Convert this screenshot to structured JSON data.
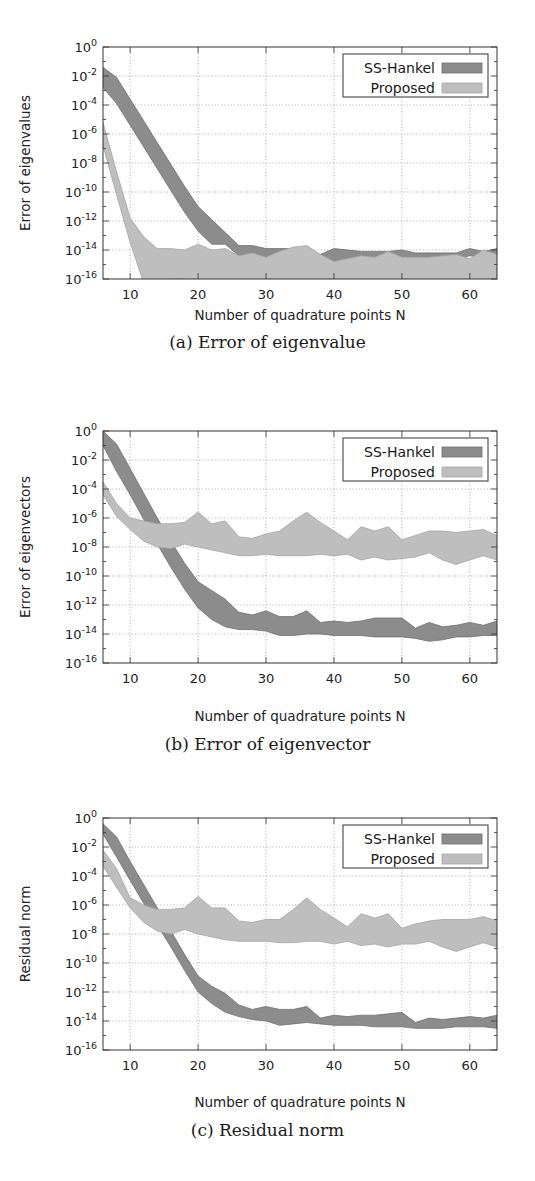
{
  "colors": {
    "ss_hankel_fill": "#8c8c8c",
    "ss_hankel_edge": "#6e6e6e",
    "proposed_fill": "#bebebe",
    "proposed_edge": "#a5a5a5",
    "grid": "#9a9a9a",
    "frame": "#333333"
  },
  "chart_data": [
    {
      "id": "a",
      "type": "area",
      "caption": "(a) Error of eigenvalue",
      "title": "",
      "xlabel": "Number of quadrature points N",
      "ylabel": "Error of eigenvalues",
      "xlim": [
        6,
        64
      ],
      "ylim_log10": [
        -16,
        0
      ],
      "yscale": "log",
      "grid": true,
      "legend_position": "upper right",
      "x_ticks": [
        10,
        20,
        30,
        40,
        50,
        60
      ],
      "y_ticks": [
        "10^0",
        "10^-2",
        "10^-4",
        "10^-6",
        "10^-8",
        "10^-10",
        "10^-12",
        "10^-14",
        "10^-16"
      ],
      "legend": [
        "SS-Hankel",
        "Proposed"
      ],
      "x": [
        6,
        8,
        10,
        12,
        14,
        16,
        18,
        20,
        22,
        24,
        26,
        28,
        30,
        32,
        34,
        36,
        38,
        40,
        42,
        44,
        46,
        48,
        50,
        52,
        54,
        56,
        58,
        60,
        62,
        64
      ],
      "series": [
        {
          "name": "SS-Hankel",
          "upper_log10": [
            -1.4,
            -2.1,
            -3.6,
            -5.1,
            -6.6,
            -8.1,
            -9.6,
            -11.0,
            -11.9,
            -12.8,
            -13.7,
            -13.7,
            -13.9,
            -13.9,
            -13.9,
            -14.1,
            -14.3,
            -13.9,
            -14.0,
            -14.1,
            -14.1,
            -14.1,
            -14.0,
            -14.2,
            -14.2,
            -14.2,
            -14.2,
            -13.9,
            -14.1,
            -13.9
          ],
          "lower_log10": [
            -2.8,
            -3.9,
            -5.4,
            -6.9,
            -8.4,
            -9.9,
            -11.4,
            -12.7,
            -13.6,
            -13.6,
            -14.4,
            -14.3,
            -14.5,
            -14.4,
            -14.3,
            -14.2,
            -14.5,
            -14.9,
            -14.7,
            -14.6,
            -14.6,
            -14.6,
            -14.6,
            -14.5,
            -14.6,
            -14.6,
            -14.6,
            -14.4,
            -14.5,
            -14.3
          ]
        },
        {
          "name": "Proposed",
          "upper_log10": [
            -5.2,
            -8.6,
            -11.8,
            -13.1,
            -13.9,
            -13.9,
            -14.0,
            -13.6,
            -14.0,
            -13.9,
            -14.4,
            -14.2,
            -14.5,
            -14.1,
            -13.8,
            -13.7,
            -14.3,
            -14.8,
            -14.6,
            -14.4,
            -14.5,
            -14.1,
            -14.5,
            -14.5,
            -14.5,
            -14.4,
            -14.3,
            -14.6,
            -14.0,
            -14.3
          ],
          "lower_log10": [
            -6.8,
            -10.2,
            -13.5,
            -16.3,
            -16.3,
            -16.0,
            -16.0,
            -16.3,
            -16.3,
            -16.3,
            -16.3,
            -16.3,
            -16.3,
            -16.3,
            -16.3,
            -16.3,
            -16.3,
            -16.3,
            -16.3,
            -16.3,
            -16.3,
            -16.3,
            -16.3,
            -16.3,
            -16.3,
            -16.3,
            -16.3,
            -16.3,
            -16.3,
            -16.3
          ]
        }
      ]
    },
    {
      "id": "b",
      "type": "area",
      "caption": "(b) Error of eigenvector",
      "title": "",
      "xlabel": "Number of quadrature points N",
      "ylabel": "Error of eigenvectors",
      "xlim": [
        6,
        64
      ],
      "ylim_log10": [
        -16,
        0
      ],
      "yscale": "log",
      "grid": true,
      "legend_position": "upper right",
      "x_ticks": [
        10,
        20,
        30,
        40,
        50,
        60
      ],
      "y_ticks": [
        "10^0",
        "10^-2",
        "10^-4",
        "10^-6",
        "10^-8",
        "10^-10",
        "10^-12",
        "10^-14",
        "10^-16"
      ],
      "legend": [
        "SS-Hankel",
        "Proposed"
      ],
      "x": [
        6,
        8,
        10,
        12,
        14,
        16,
        18,
        20,
        22,
        24,
        26,
        28,
        30,
        32,
        34,
        36,
        38,
        40,
        42,
        44,
        46,
        48,
        50,
        52,
        54,
        56,
        58,
        60,
        62,
        64
      ],
      "series": [
        {
          "name": "SS-Hankel",
          "upper_log10": [
            0.0,
            -0.9,
            -2.6,
            -4.3,
            -6.0,
            -7.6,
            -9.1,
            -10.4,
            -11.0,
            -11.6,
            -12.5,
            -12.7,
            -12.4,
            -12.8,
            -12.8,
            -12.4,
            -13.2,
            -13.1,
            -13.2,
            -13.1,
            -12.9,
            -12.9,
            -12.9,
            -13.6,
            -13.2,
            -13.5,
            -13.4,
            -13.2,
            -13.4,
            -13.1
          ],
          "lower_log10": [
            -1.0,
            -2.8,
            -4.4,
            -6.1,
            -7.8,
            -9.4,
            -10.9,
            -12.2,
            -13.0,
            -13.5,
            -13.7,
            -13.7,
            -13.8,
            -14.1,
            -14.1,
            -14.0,
            -14.0,
            -14.1,
            -14.1,
            -14.1,
            -14.2,
            -14.2,
            -14.2,
            -14.3,
            -14.5,
            -14.4,
            -14.2,
            -14.2,
            -14.1,
            -14.1
          ]
        },
        {
          "name": "Proposed",
          "upper_log10": [
            -3.5,
            -5.0,
            -6.0,
            -6.2,
            -6.4,
            -6.4,
            -6.3,
            -5.6,
            -6.4,
            -6.2,
            -7.3,
            -7.4,
            -7.1,
            -6.9,
            -6.2,
            -5.6,
            -6.3,
            -6.9,
            -7.5,
            -6.6,
            -6.9,
            -6.6,
            -7.5,
            -7.2,
            -6.9,
            -6.9,
            -7.0,
            -6.9,
            -6.8,
            -7.2
          ],
          "lower_log10": [
            -4.4,
            -5.9,
            -6.8,
            -7.6,
            -8.0,
            -8.1,
            -7.8,
            -8.0,
            -8.2,
            -8.4,
            -8.6,
            -8.6,
            -8.5,
            -8.6,
            -8.6,
            -8.6,
            -8.5,
            -8.6,
            -8.5,
            -8.9,
            -8.7,
            -8.9,
            -8.8,
            -8.7,
            -8.4,
            -8.9,
            -9.2,
            -8.9,
            -8.6,
            -8.9
          ]
        }
      ]
    },
    {
      "id": "c",
      "type": "area",
      "caption": "(c) Residual norm",
      "title": "",
      "xlabel": "Number of quadrature points N",
      "ylabel": "Residual norm",
      "xlim": [
        6,
        64
      ],
      "ylim_log10": [
        -16,
        0
      ],
      "yscale": "log",
      "grid": true,
      "legend_position": "upper right",
      "x_ticks": [
        10,
        20,
        30,
        40,
        50,
        60
      ],
      "y_ticks": [
        "10^0",
        "10^-2",
        "10^-4",
        "10^-6",
        "10^-8",
        "10^-10",
        "10^-12",
        "10^-14",
        "10^-16"
      ],
      "legend": [
        "SS-Hankel",
        "Proposed"
      ],
      "x": [
        6,
        8,
        10,
        12,
        14,
        16,
        18,
        20,
        22,
        24,
        26,
        28,
        30,
        32,
        34,
        36,
        38,
        40,
        42,
        44,
        46,
        48,
        50,
        52,
        54,
        56,
        58,
        60,
        62,
        64
      ],
      "series": [
        {
          "name": "SS-Hankel",
          "upper_log10": [
            -0.4,
            -1.3,
            -3.0,
            -4.6,
            -6.2,
            -7.8,
            -9.4,
            -10.9,
            -11.6,
            -12.1,
            -12.9,
            -13.2,
            -13.0,
            -13.2,
            -13.2,
            -13.0,
            -13.8,
            -13.6,
            -13.7,
            -13.6,
            -13.6,
            -13.5,
            -13.4,
            -14.1,
            -13.8,
            -13.9,
            -13.8,
            -13.7,
            -13.8,
            -13.6
          ],
          "lower_log10": [
            -1.1,
            -2.7,
            -4.3,
            -5.9,
            -7.4,
            -8.9,
            -10.5,
            -12.0,
            -12.8,
            -13.4,
            -13.7,
            -13.9,
            -14.0,
            -14.3,
            -14.2,
            -14.1,
            -14.2,
            -14.3,
            -14.3,
            -14.3,
            -14.4,
            -14.4,
            -14.4,
            -14.5,
            -14.5,
            -14.5,
            -14.4,
            -14.4,
            -14.4,
            -14.5
          ]
        },
        {
          "name": "Proposed",
          "upper_log10": [
            -2.2,
            -3.5,
            -5.5,
            -6.0,
            -6.3,
            -6.3,
            -6.2,
            -5.4,
            -6.2,
            -6.2,
            -7.1,
            -7.2,
            -7.0,
            -7.0,
            -6.3,
            -5.5,
            -6.3,
            -6.9,
            -7.5,
            -6.6,
            -6.9,
            -6.6,
            -7.6,
            -7.3,
            -7.1,
            -7.0,
            -7.0,
            -7.0,
            -6.8,
            -7.1
          ],
          "lower_log10": [
            -3.3,
            -4.8,
            -6.2,
            -7.2,
            -7.8,
            -8.0,
            -7.7,
            -8.0,
            -8.2,
            -8.4,
            -8.5,
            -8.5,
            -8.5,
            -8.6,
            -8.6,
            -8.5,
            -8.5,
            -8.7,
            -8.5,
            -8.8,
            -8.7,
            -8.9,
            -8.7,
            -8.7,
            -8.5,
            -8.9,
            -9.2,
            -8.9,
            -8.6,
            -8.9
          ]
        }
      ]
    }
  ]
}
